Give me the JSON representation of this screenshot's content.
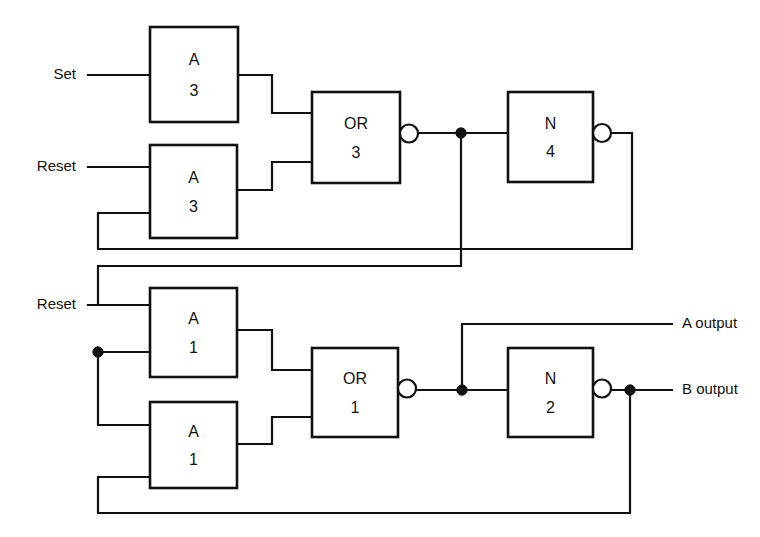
{
  "diagram": {
    "width": 760,
    "height": 537,
    "background_color": "#ffffff",
    "line_color": "#111111"
  },
  "inputs": [
    {
      "id": "set",
      "label": "Set",
      "x": 88,
      "y": 75
    },
    {
      "id": "reset_top",
      "label": "Reset",
      "x": 88,
      "y": 167
    },
    {
      "id": "reset_bottom",
      "label": "Reset",
      "x": 88,
      "y": 305
    }
  ],
  "outputs": [
    {
      "id": "a_output",
      "label": "A output",
      "x": 672,
      "y": 324
    },
    {
      "id": "b_output",
      "label": "B output",
      "x": 672,
      "y": 390
    }
  ],
  "gates": [
    {
      "id": "a3_top",
      "type_label": "A",
      "number_label": "3",
      "x": 150,
      "y": 27,
      "w": 88,
      "h": 95,
      "inverted": false
    },
    {
      "id": "a3_bot",
      "type_label": "A",
      "number_label": "3",
      "x": 150,
      "y": 145,
      "w": 87,
      "h": 93,
      "inverted": false
    },
    {
      "id": "or3",
      "type_label": "OR",
      "number_label": "3",
      "x": 312,
      "y": 92,
      "w": 88,
      "h": 91,
      "inverted": true
    },
    {
      "id": "n4",
      "type_label": "N",
      "number_label": "4",
      "x": 508,
      "y": 92,
      "w": 85,
      "h": 90,
      "inverted": true
    },
    {
      "id": "a1_top",
      "type_label": "A",
      "number_label": "1",
      "x": 150,
      "y": 288,
      "w": 87,
      "h": 89,
      "inverted": false
    },
    {
      "id": "a1_bot",
      "type_label": "A",
      "number_label": "1",
      "x": 150,
      "y": 402,
      "w": 87,
      "h": 86,
      "inverted": false
    },
    {
      "id": "or1",
      "type_label": "OR",
      "number_label": "1",
      "x": 312,
      "y": 348,
      "w": 86,
      "h": 89,
      "inverted": true
    },
    {
      "id": "n2",
      "type_label": "N",
      "number_label": "2",
      "x": 508,
      "y": 348,
      "w": 85,
      "h": 89,
      "inverted": true
    }
  ],
  "junctions": [
    {
      "id": "or3-out-tap",
      "x": 461,
      "y": 133
    },
    {
      "id": "reset-branch",
      "x": 98,
      "y": 352
    },
    {
      "id": "or1-out-tap",
      "x": 462,
      "y": 390
    },
    {
      "id": "n2-out-tap",
      "x": 630,
      "y": 390
    }
  ],
  "wires": [
    {
      "id": "set-to-a3top",
      "d": "M 88 75 L 150 75"
    },
    {
      "id": "resettop-to-a3bot",
      "d": "M 88 167 L 150 167"
    },
    {
      "id": "a3top-out-to-or3",
      "d": "M 238 75 L 272 75 L 272 113 L 312 113"
    },
    {
      "id": "a3bot-out-to-or3",
      "d": "M 237 190 L 272 190 L 272 162 L 312 162"
    },
    {
      "id": "or3-out-to-n4",
      "d": "M 417 133 L 508 133"
    },
    {
      "id": "n4-feedback-to-a3bot",
      "d": "M 611 133 L 632 133 L 632 249 L 98 249 L 98 213 L 150 213"
    },
    {
      "id": "or3-tap-down-to-lower",
      "d": "M 461 133 L 461 266 L 98 266 L 98 305"
    },
    {
      "id": "resetbot-to-a1top",
      "d": "M 88 305 L 150 305"
    },
    {
      "id": "reset-branch-to-a1top",
      "d": "M 98 352 L 150 352"
    },
    {
      "id": "reset-branch-to-a1bot",
      "d": "M 98 352 L 98 425 L 150 425"
    },
    {
      "id": "a1top-out-to-or1",
      "d": "M 237 330 L 272 330 L 272 370 L 312 370"
    },
    {
      "id": "a1bot-out-to-or1",
      "d": "M 237 444 L 272 444 L 272 417 L 312 417"
    },
    {
      "id": "or1-out-to-n2",
      "d": "M 417 390 L 508 390"
    },
    {
      "id": "or1-tap-to-aoutput",
      "d": "M 462 390 L 462 324 L 672 324"
    },
    {
      "id": "n2-out-to-boutput",
      "d": "M 611 390 L 672 390"
    },
    {
      "id": "n2-feedback-to-a1bot",
      "d": "M 630 390 L 630 513 L 98 513 L 98 477 L 150 477"
    }
  ]
}
